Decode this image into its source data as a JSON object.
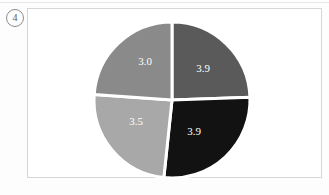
{
  "figure": {
    "marker_label": "4",
    "background_color": "#fdfdfd",
    "frame_color": "#d6d6d6"
  },
  "chart_data": {
    "type": "pie",
    "title": "",
    "xlabel": "",
    "ylabel": "",
    "grid": false,
    "legend": "none",
    "start_angle_deg": 90,
    "direction": "clockwise",
    "center": {
      "x": 172,
      "y": 100
    },
    "radius": 78,
    "gap_color": "#ffffff",
    "label_color": "#ffffff",
    "total": 14.3,
    "categories": [
      "Segment 1",
      "Segment 2",
      "Segment 3",
      "Segment 4"
    ],
    "values": [
      3.9,
      3.9,
      3.5,
      3.0
    ],
    "colors": [
      "#5a5a5a",
      "#121212",
      "#a8a8a8",
      "#8a8a8a"
    ],
    "slices": [
      {
        "label": "3.9",
        "value": 3.9,
        "color": "#5a5a5a",
        "position": "top-right",
        "start_deg": 90,
        "end_deg": 2,
        "label_x": 203,
        "label_y": 69
      },
      {
        "label": "3.9",
        "value": 3.9,
        "color": "#121212",
        "position": "bottom-right",
        "start_deg": 2,
        "end_deg": -96,
        "label_x": 194,
        "label_y": 132
      },
      {
        "label": "3.5",
        "value": 3.5,
        "color": "#a8a8a8",
        "position": "bottom-left",
        "start_deg": -96,
        "end_deg": -184,
        "label_x": 136,
        "label_y": 122
      },
      {
        "label": "3.0",
        "value": 3.0,
        "color": "#8a8a8a",
        "position": "top-left",
        "start_deg": -184,
        "end_deg": -270,
        "label_x": 145,
        "label_y": 62
      }
    ]
  }
}
